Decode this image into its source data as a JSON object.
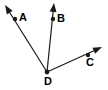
{
  "figure": {
    "type": "geometry-diagram",
    "width": 108,
    "height": 90,
    "background_color": "#ffffff",
    "stroke_color": "#1a1a1a",
    "label_color": "#000000"
  },
  "vertex": {
    "label": "D",
    "name": "vertex-d",
    "x": 47,
    "y": 72,
    "label_x": 48,
    "label_y": 82,
    "dot_radius": 2.4
  },
  "rays": [
    {
      "label": "A",
      "name": "ray-da",
      "from_x": 47,
      "from_y": 72,
      "point_x": 15,
      "point_y": 19,
      "tip_x": 5,
      "tip_y": 5,
      "label_x": 23,
      "label_y": 18,
      "dot_radius": 2.2,
      "stroke_width": 1.2
    },
    {
      "label": "B",
      "name": "ray-db",
      "from_x": 47,
      "from_y": 72,
      "point_x": 53,
      "point_y": 19,
      "tip_x": 54,
      "tip_y": 3,
      "label_x": 61,
      "label_y": 19,
      "dot_radius": 2.2,
      "stroke_width": 1.2
    },
    {
      "label": "C",
      "name": "ray-dc",
      "from_x": 47,
      "from_y": 72,
      "point_x": 88,
      "point_y": 55,
      "tip_x": 102,
      "tip_y": 47,
      "label_x": 90,
      "label_y": 63,
      "dot_radius": 2.2,
      "stroke_width": 1.2
    }
  ]
}
